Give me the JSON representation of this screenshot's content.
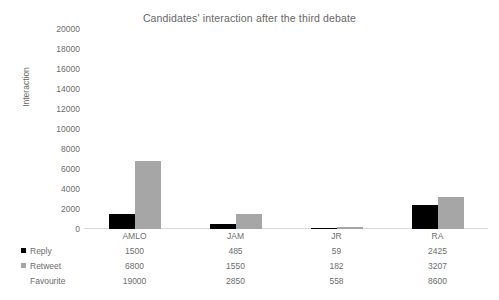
{
  "chart_data": {
    "type": "bar",
    "title": "Candidates' interaction after the third debate",
    "xlabel": "",
    "ylabel": "Interaction",
    "ylim": [
      0,
      20000
    ],
    "ytick_step": 2000,
    "yticks": [
      "20000",
      "18000",
      "16000",
      "14000",
      "12000",
      "10000",
      "8000",
      "6000",
      "4000",
      "2000",
      "0"
    ],
    "grid": false,
    "legend_position": "bottom-table",
    "categories": [
      "AMLO",
      "JAM",
      "JR",
      "RA"
    ],
    "series": [
      {
        "name": "Reply",
        "color": "#000000",
        "plotted": true,
        "values": [
          1500,
          485,
          59,
          2425
        ],
        "labels": [
          "1500",
          "485",
          "59",
          "2425"
        ]
      },
      {
        "name": "Retweet",
        "color": "#a6a6a6",
        "plotted": true,
        "values": [
          6800,
          1550,
          182,
          3207
        ],
        "labels": [
          "6800",
          "1550",
          "182",
          "3207"
        ]
      },
      {
        "name": "Favourite",
        "color": "#d9d9d9",
        "plotted": false,
        "values": [
          19000,
          2850,
          558,
          8600
        ],
        "labels": [
          "19000",
          "2850",
          "558",
          "8600"
        ]
      }
    ]
  }
}
